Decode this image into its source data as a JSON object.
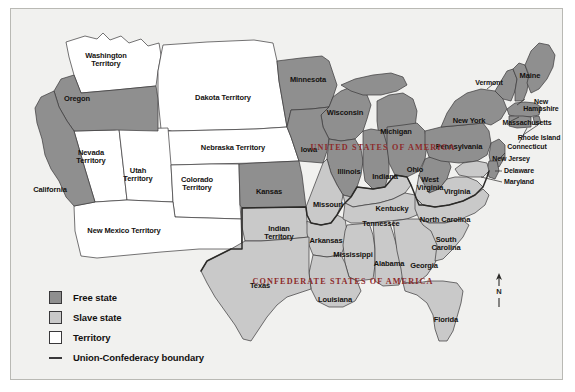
{
  "map": {
    "title": "United States 1861 — Free states, slave states and territories",
    "background_color": "#f1f1ef",
    "colors": {
      "free_state": "#8f8f8f",
      "slave_state": "#c9c9c9",
      "territory": "#ffffff",
      "outline": "#39383a",
      "nation_label": "#8d2b2b",
      "water": "#f1f1ef"
    },
    "nation_labels": [
      {
        "text": "UNITED STATES OF AMERICA",
        "x": 372,
        "y": 138
      },
      {
        "text": "CONFEDERATE STATES OF AMERICA",
        "x": 332,
        "y": 272
      }
    ],
    "regions": [
      {
        "name": "Washington Territory",
        "label": "Washington\nTerritory",
        "category": "territory",
        "x": 95,
        "y": 51
      },
      {
        "name": "Oregon",
        "label": "Oregon",
        "category": "free_state",
        "x": 66,
        "y": 90
      },
      {
        "name": "Nevada Territory",
        "label": "Nevada\nTerritory",
        "category": "territory",
        "x": 80,
        "y": 148
      },
      {
        "name": "California",
        "label": "California",
        "category": "free_state",
        "x": 39,
        "y": 181
      },
      {
        "name": "Utah Territory",
        "label": "Utah\nTerritory",
        "category": "territory",
        "x": 127,
        "y": 166
      },
      {
        "name": "Colorado Territory",
        "label": "Colorado\nTerritory",
        "category": "territory",
        "x": 186,
        "y": 175
      },
      {
        "name": "New Mexico Territory",
        "label": "New Mexico Territory",
        "category": "territory",
        "x": 113,
        "y": 222
      },
      {
        "name": "Dakota Territory",
        "label": "Dakota Territory",
        "category": "territory",
        "x": 212,
        "y": 89
      },
      {
        "name": "Nebraska Territory",
        "label": "Nebraska Territory",
        "category": "territory",
        "x": 222,
        "y": 139
      },
      {
        "name": "Kansas",
        "label": "Kansas",
        "category": "free_state",
        "x": 258,
        "y": 183
      },
      {
        "name": "Indian Territory",
        "label": "Indian\nTerritory",
        "category": "slave_state",
        "x": 268,
        "y": 224
      },
      {
        "name": "Texas",
        "label": "Texas",
        "category": "slave_state",
        "x": 249,
        "y": 277
      },
      {
        "name": "Minnesota",
        "label": "Minnesota",
        "category": "free_state",
        "x": 297,
        "y": 71
      },
      {
        "name": "Wisconsin",
        "label": "Wisconsin",
        "category": "free_state",
        "x": 334,
        "y": 104
      },
      {
        "name": "Iowa",
        "label": "Iowa",
        "category": "free_state",
        "x": 298,
        "y": 141
      },
      {
        "name": "Michigan",
        "label": "Michigan",
        "category": "free_state",
        "x": 385,
        "y": 123
      },
      {
        "name": "Illinois",
        "label": "Illinois",
        "category": "free_state",
        "x": 338,
        "y": 163
      },
      {
        "name": "Indiana",
        "label": "Indiana",
        "category": "free_state",
        "x": 374,
        "y": 168
      },
      {
        "name": "Ohio",
        "label": "Ohio",
        "category": "free_state",
        "x": 404,
        "y": 161
      },
      {
        "name": "Missouri",
        "label": "Missouri",
        "category": "slave_state",
        "x": 317,
        "y": 196
      },
      {
        "name": "Kentucky",
        "label": "Kentucky",
        "category": "slave_state",
        "x": 381,
        "y": 200
      },
      {
        "name": "Tennessee",
        "label": "Tennessee",
        "category": "slave_state",
        "x": 370,
        "y": 215
      },
      {
        "name": "Arkansas",
        "label": "Arkansas",
        "category": "slave_state",
        "x": 315,
        "y": 232
      },
      {
        "name": "Mississippi",
        "label": "Mississippi",
        "category": "slave_state",
        "x": 342,
        "y": 246
      },
      {
        "name": "Alabama",
        "label": "Alabama",
        "category": "slave_state",
        "x": 378,
        "y": 255
      },
      {
        "name": "Georgia",
        "label": "Georgia",
        "category": "slave_state",
        "x": 413,
        "y": 257
      },
      {
        "name": "Louisiana",
        "label": "Louisiana",
        "category": "slave_state",
        "x": 324,
        "y": 291
      },
      {
        "name": "Florida",
        "label": "Florida",
        "category": "slave_state",
        "x": 435,
        "y": 311
      },
      {
        "name": "North Carolina",
        "label": "North Carolina",
        "category": "slave_state",
        "x": 434,
        "y": 211
      },
      {
        "name": "South Carolina",
        "label": "South\nCarolina",
        "category": "slave_state",
        "x": 435,
        "y": 235
      },
      {
        "name": "Virginia",
        "label": "Virginia",
        "category": "slave_state",
        "x": 446,
        "y": 183
      },
      {
        "name": "West Virginia",
        "label": "West\nVirginia",
        "category": "free_state",
        "x": 419,
        "y": 175
      },
      {
        "name": "Pennsylvania",
        "label": "Pennsylvania",
        "category": "free_state",
        "x": 448,
        "y": 138
      },
      {
        "name": "New York",
        "label": "New York",
        "category": "free_state",
        "x": 458,
        "y": 112
      },
      {
        "name": "Vermont",
        "label": "Vermont",
        "category": "free_state",
        "x": 478,
        "y": 74
      },
      {
        "name": "Maine",
        "label": "Maine",
        "category": "free_state",
        "x": 519,
        "y": 67
      },
      {
        "name": "New Hampshire",
        "label": "New\nHampshire",
        "category": "free_state",
        "x": 530,
        "y": 96
      },
      {
        "name": "Massachusetts",
        "label": "Massachusetts",
        "category": "free_state",
        "x": 516,
        "y": 114
      },
      {
        "name": "Rhode Island",
        "label": "Rhode Island",
        "category": "free_state",
        "x": 528,
        "y": 129
      },
      {
        "name": "Connecticut",
        "label": "Connecticut",
        "category": "free_state",
        "x": 516,
        "y": 138
      },
      {
        "name": "New Jersey",
        "label": "New Jersey",
        "category": "free_state",
        "x": 500,
        "y": 150
      },
      {
        "name": "Delaware",
        "label": "Delaware",
        "category": "free_state",
        "x": 508,
        "y": 162
      },
      {
        "name": "Maryland",
        "label": "Maryland",
        "category": "slave_state",
        "x": 508,
        "y": 173
      }
    ]
  },
  "legend": {
    "items": [
      {
        "key": "free_state",
        "label": "Free state",
        "swatch": "free"
      },
      {
        "key": "slave_state",
        "label": "Slave state",
        "swatch": "slave"
      },
      {
        "key": "territory",
        "label": "Territory",
        "swatch": "terr"
      },
      {
        "key": "boundary",
        "label": "Union-Confederacy boundary",
        "swatch": "line"
      }
    ]
  },
  "compass": {
    "direction_label": "N"
  }
}
